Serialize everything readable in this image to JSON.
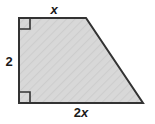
{
  "figure": {
    "type": "right-trapezoid",
    "labels": {
      "top_side": "x",
      "left_side": "2",
      "bottom_side": "2x",
      "bottom_number": "2",
      "bottom_variable": "x"
    },
    "colors": {
      "fill": "#d6d6d6",
      "hatch": "#cacaca",
      "stroke": "#333333",
      "label": "#1a1a1a",
      "background": "#ffffff"
    },
    "geometry": {
      "vertices": "19,18 86,18 143,103 19,103",
      "right_angle_markers": [
        {
          "x": 19,
          "y": 18,
          "size": 11,
          "corner": "top-left"
        },
        {
          "x": 19,
          "y": 103,
          "size": 11,
          "corner": "bottom-left"
        }
      ],
      "stroke_width": 2
    }
  }
}
